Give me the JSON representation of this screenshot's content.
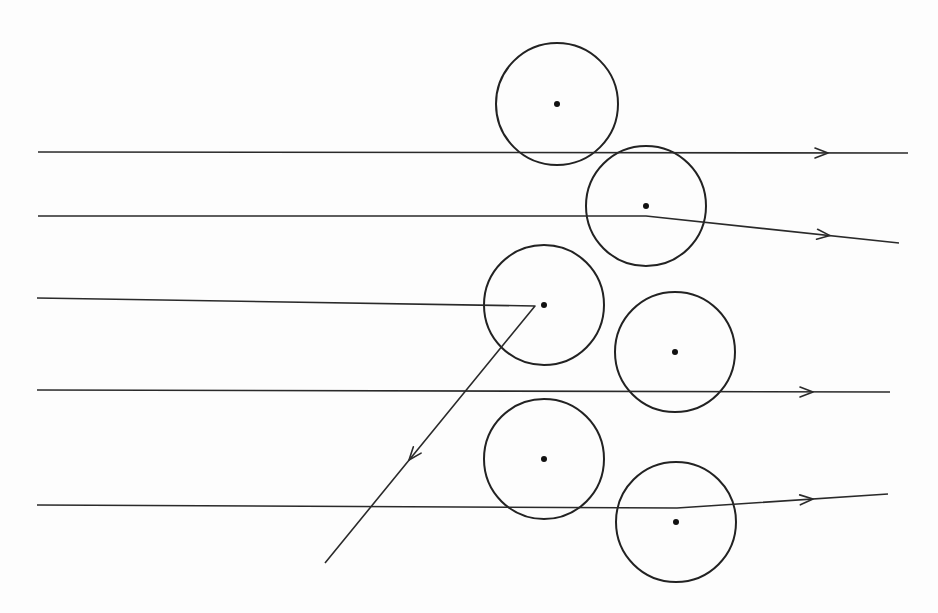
{
  "diagram": {
    "type": "scattering-diagram",
    "colors": {
      "background": "#fdfdfd",
      "stroke": "#222222"
    },
    "nuclei": [
      {
        "id": "nucleus-1",
        "cx": 557,
        "cy": 104,
        "r": 61
      },
      {
        "id": "nucleus-2",
        "cx": 646,
        "cy": 206,
        "r": 60
      },
      {
        "id": "nucleus-3",
        "cx": 544,
        "cy": 305,
        "r": 60
      },
      {
        "id": "nucleus-4",
        "cx": 675,
        "cy": 352,
        "r": 60
      },
      {
        "id": "nucleus-5",
        "cx": 544,
        "cy": 459,
        "r": 60
      },
      {
        "id": "nucleus-6",
        "cx": 676,
        "cy": 522,
        "r": 60
      }
    ],
    "trajectories": [
      {
        "id": "ray-1-undeflected",
        "points": [
          [
            38,
            152
          ],
          [
            908,
            153
          ]
        ],
        "arrow": {
          "x": 828,
          "y": 153,
          "angle": 0
        }
      },
      {
        "id": "ray-2-deflected",
        "points": [
          [
            38,
            216
          ],
          [
            646,
            216
          ],
          [
            899,
            243
          ]
        ],
        "arrow": {
          "x": 830,
          "y": 235.6,
          "angle": 6.1
        }
      },
      {
        "id": "ray-3-backscattered",
        "points": [
          [
            37,
            298
          ],
          [
            535,
            306
          ],
          [
            325,
            563
          ]
        ],
        "arrow": {
          "x": 409,
          "y": 460,
          "angle": 129.3
        }
      },
      {
        "id": "ray-4-undeflected",
        "points": [
          [
            37,
            390
          ],
          [
            890,
            392
          ]
        ],
        "arrow": {
          "x": 813,
          "y": 392,
          "angle": 0
        }
      },
      {
        "id": "ray-5-deflected",
        "points": [
          [
            37,
            505
          ],
          [
            677,
            508
          ],
          [
            888,
            494
          ]
        ],
        "arrow": {
          "x": 813,
          "y": 499,
          "angle": -3.8
        }
      }
    ]
  }
}
